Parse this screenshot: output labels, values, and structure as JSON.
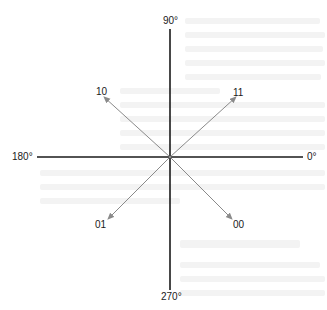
{
  "diagram": {
    "type": "constellation-axes",
    "center": {
      "x": 170,
      "y": 157
    },
    "axis_labels": {
      "top": "90°",
      "right": "0°",
      "bottom": "270°",
      "left": "180°"
    },
    "points": [
      {
        "label": "10",
        "angle_deg": 135,
        "quadrant": "upper-left"
      },
      {
        "label": "11",
        "angle_deg": 45,
        "quadrant": "upper-right"
      },
      {
        "label": "01",
        "angle_deg": 225,
        "quadrant": "lower-left"
      },
      {
        "label": "00",
        "angle_deg": 315,
        "quadrant": "lower-right"
      }
    ],
    "colors": {
      "axis": "#1a1a1a",
      "arrow": "#8a8a8a",
      "text": "#1a1a1a"
    }
  }
}
